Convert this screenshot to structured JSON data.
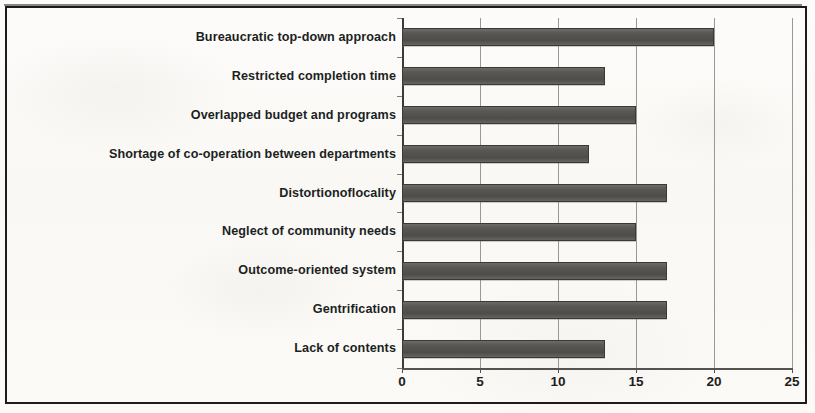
{
  "figure": {
    "background_color": "#fbfaf8",
    "border_color": "#1d1c1b"
  },
  "chart_data": {
    "type": "bar",
    "orientation": "horizontal",
    "title": "",
    "subtitle": "",
    "xlabel": "",
    "ylabel": "",
    "xlim": [
      0,
      25
    ],
    "ylim": null,
    "grid": true,
    "grid_axis": "x",
    "legend": false,
    "legend_position": "none",
    "bar_color": "#595754",
    "categories": [
      "Bureaucratic top-down approach",
      "Restricted completion time",
      "Overlapped budget and programs",
      "Shortage of co-operation between departments",
      "Distortionoflocality",
      "Neglect of community needs",
      "Outcome-oriented system",
      "Gentrification",
      "Lack of contents"
    ],
    "values": [
      20,
      13,
      15,
      12,
      17,
      15,
      17,
      17,
      13
    ],
    "xticks": [
      0,
      5,
      10,
      15,
      20,
      25
    ],
    "xtick_labels": [
      "0",
      "5",
      "10",
      "15",
      "20",
      "25"
    ]
  }
}
